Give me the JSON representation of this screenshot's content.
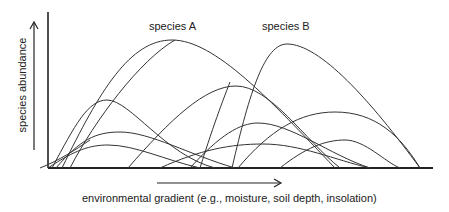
{
  "diagram": {
    "title": "",
    "y_axis_label": "species abundance",
    "x_axis_label": "environmental gradient (e.g., moisture, soil depth, insolation)",
    "annotations": [
      "species A",
      "species B"
    ],
    "colors": {
      "line": "#222222",
      "background": "#ffffff"
    }
  },
  "curves": [
    {
      "name": "species A",
      "start_x": 62,
      "peak_x": 172,
      "peak_y": 40,
      "end_x": 335
    },
    {
      "name": "species B",
      "start_x": 232,
      "peak_x": 287,
      "peak_y": 44,
      "end_x": 420
    },
    {
      "name": "curve-3",
      "start_x": 52,
      "peak_x": 107,
      "peak_y": 100,
      "end_x": 215
    },
    {
      "name": "curve-4",
      "start_x": 56,
      "peak_x": 120,
      "peak_y": 132,
      "end_x": 235
    },
    {
      "name": "curve-5",
      "start_x": 48,
      "peak_x": 108,
      "peak_y": 145,
      "end_x": 200
    },
    {
      "name": "curve-6",
      "start_x": 128,
      "peak_x": 236,
      "peak_y": 86,
      "end_x": 340
    },
    {
      "name": "curve-7",
      "start_x": 190,
      "peak_x": 258,
      "peak_y": 123,
      "end_x": 370
    },
    {
      "name": "curve-8",
      "start_x": 238,
      "peak_x": 335,
      "peak_y": 112,
      "end_x": 420
    },
    {
      "name": "curve-9",
      "start_x": 280,
      "peak_x": 345,
      "peak_y": 140,
      "end_x": 400
    },
    {
      "name": "curve-10",
      "start_x": 160,
      "peak_x": 263,
      "peak_y": 144,
      "end_x": 370
    }
  ]
}
